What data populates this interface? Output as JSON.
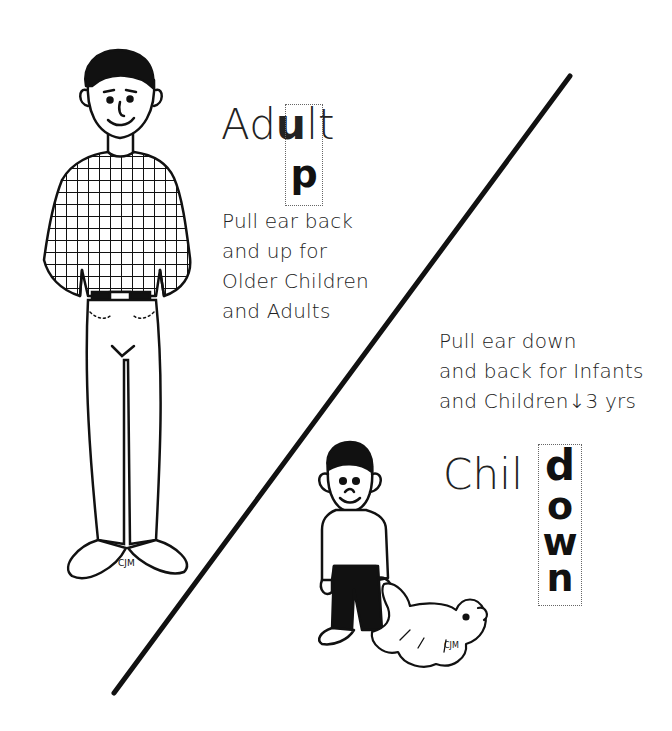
{
  "adult": {
    "title_prefix": "Ad",
    "title_highlight": "u",
    "title_suffix": "lt",
    "vertical_letter": "p",
    "direction_word": "up",
    "instructions": [
      "Pull ear back",
      "and up for",
      "Older Children",
      "and Adults"
    ],
    "signature": "CJM"
  },
  "child": {
    "title_prefix": "Chil",
    "vertical_letters": [
      "d",
      "o",
      "w",
      "n"
    ],
    "direction_word": "down",
    "instructions": [
      "Pull ear down",
      "and back for Infants",
      "and Children↓3 yrs"
    ],
    "signature": "CJM"
  },
  "divider": {
    "from": [
      114,
      693
    ],
    "to": [
      570,
      76
    ],
    "color": "#111111"
  }
}
